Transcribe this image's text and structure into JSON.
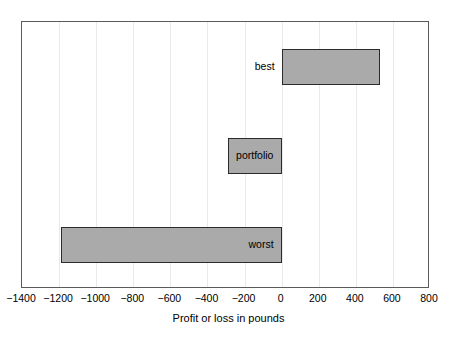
{
  "chart_data": {
    "type": "bar",
    "orientation": "horizontal",
    "title": "",
    "xlabel": "Profit or loss in pounds",
    "ylabel": "",
    "xlim": [
      -1400,
      800
    ],
    "xticks": [
      -1400,
      -1200,
      -1000,
      -800,
      -600,
      -400,
      -200,
      0,
      200,
      400,
      600,
      800
    ],
    "xticklabels": [
      "−1400",
      "−1200",
      "−1000",
      "−800",
      "−600",
      "−400",
      "−200",
      "0",
      "200",
      "400",
      "600",
      "800"
    ],
    "grid": true,
    "grid_axis": "x",
    "legend": false,
    "categories": [
      "best",
      "portfolio",
      "worst"
    ],
    "bars": [
      {
        "label": "best",
        "start": 0,
        "end": 530,
        "value": 530,
        "label_position": "outside-left"
      },
      {
        "label": "portfolio",
        "start": -290,
        "end": 0,
        "value": -290,
        "label_position": "inside-center"
      },
      {
        "label": "worst",
        "start": -1190,
        "end": 0,
        "value": -1190,
        "label_position": "inside-right"
      }
    ],
    "bar_fill_color": "#aaaaaa",
    "bar_edge_color": "#2b2b2b",
    "gridline_color": "#e9e9e9",
    "axis_color": "#5a5a5a",
    "background_color": "#ffffff"
  },
  "axis": {
    "title": "Profit or loss in pounds"
  }
}
